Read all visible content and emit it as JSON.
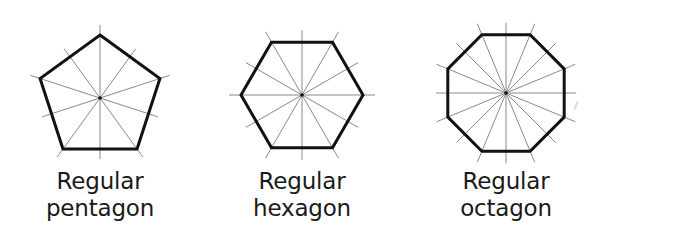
{
  "figure": {
    "colors": {
      "outline": "#111111",
      "construction_line": "#8a8a8a",
      "center_dot": "#111111",
      "text": "#1a1a1a",
      "background": "#ffffff"
    },
    "shapes": [
      {
        "id": "pentagon",
        "sides": 5,
        "center": [
          100,
          98
        ],
        "circumradius": 63,
        "rotation_deg": -90,
        "construction_line_extension": 10,
        "label_line1": "Regular",
        "label_line2": "pentagon",
        "label_center_x": 100
      },
      {
        "id": "hexagon",
        "sides": 6,
        "center": [
          302,
          95
        ],
        "circumradius": 61,
        "rotation_deg": 0,
        "construction_line_extension": 12,
        "label_line1": "Regular",
        "label_line2": "hexagon",
        "label_center_x": 302
      },
      {
        "id": "octagon",
        "sides": 8,
        "center": [
          506,
          93
        ],
        "circumradius": 63,
        "rotation_deg": 22.5,
        "construction_line_extension": 12,
        "label_line1": "Regular",
        "label_line2": "octagon",
        "label_center_x": 506
      }
    ]
  }
}
